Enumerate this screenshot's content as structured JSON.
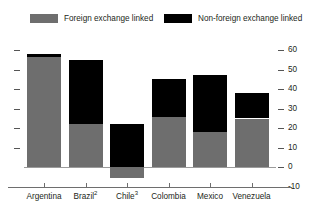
{
  "legend": {
    "items": [
      {
        "label": "Foreign exchange linked",
        "color": "#6e6e6e",
        "key": "fx"
      },
      {
        "label": "Non-foreign exchange linked",
        "color": "#000000",
        "key": "nonfx"
      }
    ]
  },
  "axis": {
    "y_ticks": [
      "60",
      "50",
      "40",
      "30",
      "20",
      "10",
      "0",
      "-10"
    ],
    "zero_label": "0"
  },
  "categories": [
    {
      "name": "Argentina",
      "footnote": ""
    },
    {
      "name": "Brazil",
      "footnote": "2"
    },
    {
      "name": "Chile",
      "footnote": "3"
    },
    {
      "name": "Colombia",
      "footnote": ""
    },
    {
      "name": "Mexico",
      "footnote": ""
    },
    {
      "name": "Venezuela",
      "footnote": ""
    }
  ],
  "chart_data": {
    "type": "bar",
    "title": "",
    "xlabel": "",
    "ylabel": "",
    "stacked": true,
    "grid": false,
    "legend_position": "top",
    "ylim": [
      -10,
      60
    ],
    "ytick_step": 10,
    "categories": [
      "Argentina",
      "Brazil",
      "Chile",
      "Colombia",
      "Mexico",
      "Venezuela"
    ],
    "category_labels": [
      "Argentina",
      "Brazil 2",
      "Chile 3",
      "Colombia",
      "Mexico",
      "Venezuela"
    ],
    "series": [
      {
        "name": "Foreign exchange linked",
        "color": "#6e6e6e",
        "values": [
          56.5,
          22,
          -5.5,
          26,
          18,
          25
        ]
      },
      {
        "name": "Non-foreign exchange linked",
        "color": "#000000",
        "values": [
          1.5,
          33,
          22,
          19,
          29,
          13
        ]
      }
    ],
    "totals": [
      58,
      55,
      16.5,
      45,
      47,
      38
    ]
  }
}
